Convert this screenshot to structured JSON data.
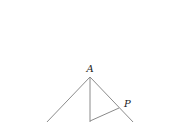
{
  "diagram": {
    "type": "geometry-figure",
    "colors": {
      "line": "#8a8a8a",
      "label": "#222222",
      "background": "#ffffff"
    },
    "points": {
      "A": {
        "label": "A",
        "x": 90,
        "y": 77
      },
      "P": {
        "label": "P",
        "x": 119,
        "y": 108
      },
      "D": {
        "label": "",
        "x": 90,
        "y": 121
      }
    },
    "segments": [
      {
        "id": "left-side",
        "from": [
          90,
          77
        ],
        "to": [
          46,
          123
        ]
      },
      {
        "id": "right-side",
        "from": [
          90,
          77
        ],
        "to": [
          134,
          123
        ]
      },
      {
        "id": "altitude",
        "from": [
          90,
          77
        ],
        "to": [
          90,
          123
        ]
      },
      {
        "id": "dp-segment",
        "from": [
          90,
          121
        ],
        "to": [
          119,
          108
        ]
      }
    ]
  }
}
